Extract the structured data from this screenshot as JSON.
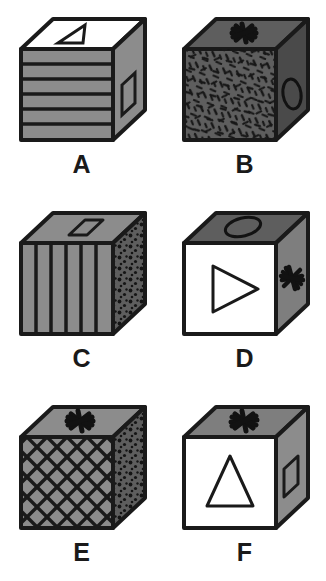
{
  "figure": {
    "background_color": "#ffffff",
    "columns": 2,
    "rows": 3,
    "stroke_color": "#1a1a1a",
    "palette": {
      "white": "#ffffff",
      "light_gray": "#9a9a9a",
      "mid_gray": "#8a8a8a",
      "gray": "#8c8c8c",
      "dark_gray": "#5e5e5e",
      "darker_gray": "#4a4a4a",
      "black": "#1a1a1a"
    }
  },
  "cubes": [
    {
      "label": "A",
      "top": {
        "fill": "white",
        "fill_hex": "#ffffff",
        "pattern": "plain",
        "symbol": "right-triangle-outline"
      },
      "front": {
        "fill": "gray",
        "fill_hex": "#8c8c8c",
        "pattern": "horizontal-stripes",
        "stripe_count": 6,
        "symbol": "none"
      },
      "right": {
        "fill": "gray",
        "fill_hex": "#8c8c8c",
        "pattern": "plain",
        "symbol": "parallelogram-outline"
      }
    },
    {
      "label": "B",
      "top": {
        "fill": "dark-gray",
        "fill_hex": "#5e5e5e",
        "pattern": "plain",
        "symbol": "asterisk"
      },
      "front": {
        "fill": "dark-gray",
        "fill_hex": "#5e5e5e",
        "pattern": "dashes-texture",
        "symbol": "none"
      },
      "right": {
        "fill": "darker-gray",
        "fill_hex": "#4a4a4a",
        "pattern": "plain",
        "symbol": "ellipse-outline"
      }
    },
    {
      "label": "C",
      "top": {
        "fill": "gray",
        "fill_hex": "#8c8c8c",
        "pattern": "plain",
        "symbol": "parallelogram-outline"
      },
      "front": {
        "fill": "gray",
        "fill_hex": "#8c8c8c",
        "pattern": "vertical-stripes",
        "stripe_count": 6,
        "symbol": "none"
      },
      "right": {
        "fill": "dark-gray",
        "fill_hex": "#5e5e5e",
        "pattern": "stipple-dots",
        "symbol": "none"
      }
    },
    {
      "label": "D",
      "top": {
        "fill": "dark-gray",
        "fill_hex": "#5e5e5e",
        "pattern": "plain",
        "symbol": "ellipse-outline"
      },
      "front": {
        "fill": "white",
        "fill_hex": "#ffffff",
        "pattern": "plain",
        "symbol": "right-pointing-triangle-outline"
      },
      "right": {
        "fill": "gray",
        "fill_hex": "#7e7e7e",
        "pattern": "plain",
        "symbol": "asterisk"
      }
    },
    {
      "label": "E",
      "top": {
        "fill": "gray",
        "fill_hex": "#8c8c8c",
        "pattern": "plain",
        "symbol": "asterisk"
      },
      "front": {
        "fill": "gray",
        "fill_hex": "#8c8c8c",
        "pattern": "diagonal-crosshatch",
        "symbol": "none"
      },
      "right": {
        "fill": "dark-gray",
        "fill_hex": "#5e5e5e",
        "pattern": "stipple-dots",
        "symbol": "none"
      }
    },
    {
      "label": "F",
      "top": {
        "fill": "gray",
        "fill_hex": "#7e7e7e",
        "pattern": "plain",
        "symbol": "asterisk"
      },
      "front": {
        "fill": "white",
        "fill_hex": "#ffffff",
        "pattern": "plain",
        "symbol": "up-triangle-outline"
      },
      "right": {
        "fill": "gray",
        "fill_hex": "#8c8c8c",
        "pattern": "plain",
        "symbol": "parallelogram-outline"
      }
    }
  ]
}
